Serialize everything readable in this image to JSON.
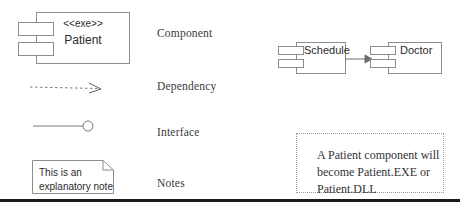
{
  "diagram": {
    "legend": [
      {
        "id": "component",
        "label": "Component"
      },
      {
        "id": "dependency",
        "label": "Dependency"
      },
      {
        "id": "interface",
        "label": "Interface"
      },
      {
        "id": "notes",
        "label": "Notes"
      }
    ],
    "components": [
      {
        "id": "patient",
        "stereotype": "<<exe>>",
        "name": "Patient"
      },
      {
        "id": "schedule",
        "stereotype": "",
        "name": "Schedule"
      },
      {
        "id": "doctor",
        "stereotype": "",
        "name": "Doctor"
      }
    ],
    "notes": [
      {
        "id": "explanatory-note",
        "style": "folded-corner",
        "text": "This is an\nexplanatory note"
      },
      {
        "id": "patient-exe-note",
        "style": "dotted-box",
        "text": "A Patient component will\nbecome Patient.EXE or\nPatient.DLL"
      }
    ],
    "connectors": [
      {
        "id": "dependency-sample",
        "kind": "dependency",
        "line": "dashed",
        "arrowhead": "open"
      },
      {
        "id": "interface-sample",
        "kind": "interface",
        "line": "solid",
        "arrowhead": "ball"
      },
      {
        "id": "schedule-to-doctor",
        "kind": "association",
        "line": "solid",
        "arrowhead": "filled",
        "source": "Schedule",
        "target": "Doctor"
      }
    ],
    "colors": {
      "stroke": "#8d8d8d",
      "connector": "#6e6e6e",
      "text": "#2b2b2b",
      "legend_text": "#3a3a3a",
      "rule": "#1a1a1a",
      "background": "#ffffff"
    }
  }
}
